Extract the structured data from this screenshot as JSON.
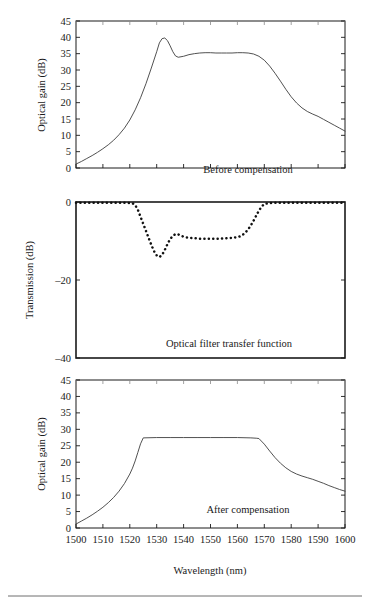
{
  "figure": {
    "shared_xlabel": "Wavelength (nm)",
    "x_ticks": [
      1500,
      1510,
      1520,
      1530,
      1540,
      1550,
      1560,
      1570,
      1580,
      1590,
      1600
    ],
    "xlim": [
      1500,
      1600
    ],
    "line_color": "#3d3d3d",
    "dotted_color": "#111111",
    "axis_color": "#1a1a1a"
  },
  "chart_data": [
    {
      "type": "line",
      "panel": "top",
      "title": "",
      "annotation": "Before compensation",
      "xlabel": "",
      "ylabel": "Optical gain (dB)",
      "xlim": [
        1500,
        1600
      ],
      "ylim": [
        0,
        45
      ],
      "y_ticks": [
        0,
        5,
        10,
        15,
        20,
        25,
        30,
        35,
        40,
        45
      ],
      "x_ticks": [
        1500,
        1510,
        1520,
        1530,
        1540,
        1550,
        1560,
        1570,
        1580,
        1590,
        1600
      ],
      "grid": false,
      "legend": "none",
      "style": "solid",
      "x": [
        1500,
        1502,
        1504,
        1506,
        1508,
        1510,
        1512,
        1514,
        1516,
        1518,
        1520,
        1522,
        1524,
        1526,
        1528,
        1530,
        1531,
        1532,
        1533,
        1534,
        1535,
        1536,
        1537,
        1538,
        1540,
        1542,
        1544,
        1546,
        1548,
        1550,
        1552,
        1554,
        1556,
        1558,
        1560,
        1562,
        1564,
        1566,
        1568,
        1570,
        1572,
        1574,
        1576,
        1578,
        1580,
        1582,
        1584,
        1586,
        1588,
        1590,
        1592,
        1594,
        1596,
        1598,
        1600
      ],
      "y": [
        1.2,
        2.0,
        2.9,
        3.8,
        4.8,
        5.9,
        7.1,
        8.5,
        10.2,
        12.2,
        14.7,
        17.8,
        21.5,
        25.8,
        30.6,
        35.6,
        38.3,
        39.6,
        39.8,
        39.0,
        37.4,
        35.6,
        34.3,
        33.9,
        34.2,
        34.7,
        35.0,
        35.2,
        35.3,
        35.3,
        35.2,
        35.2,
        35.2,
        35.2,
        35.3,
        35.3,
        35.2,
        34.9,
        34.2,
        33.0,
        31.2,
        29.0,
        26.6,
        24.1,
        21.8,
        19.9,
        18.4,
        17.3,
        16.5,
        15.8,
        14.9,
        14.0,
        13.1,
        12.2,
        11.3
      ]
    },
    {
      "type": "line",
      "panel": "middle",
      "title": "",
      "annotation": "Optical filter transfer function",
      "xlabel": "",
      "ylabel": "Transmission (dB)",
      "xlim": [
        1500,
        1600
      ],
      "ylim": [
        -40,
        0
      ],
      "y_ticks": [
        -40,
        -20,
        0
      ],
      "x_ticks": [
        1500,
        1510,
        1520,
        1530,
        1540,
        1550,
        1560,
        1570,
        1580,
        1590,
        1600
      ],
      "grid": false,
      "legend": "none",
      "style": "dotted",
      "x": [
        1500,
        1503,
        1506,
        1509,
        1512,
        1515,
        1518,
        1521,
        1522,
        1523,
        1524,
        1525,
        1526,
        1527,
        1528,
        1529,
        1530,
        1531,
        1532,
        1533,
        1534,
        1535,
        1536,
        1537,
        1538,
        1539,
        1540,
        1542,
        1544,
        1546,
        1548,
        1550,
        1552,
        1554,
        1556,
        1558,
        1560,
        1561,
        1562,
        1563,
        1564,
        1565,
        1566,
        1567,
        1568,
        1569,
        1570,
        1573,
        1576,
        1580,
        1584,
        1588,
        1592,
        1596,
        1600
      ],
      "y": [
        -0.2,
        -0.2,
        -0.2,
        -0.2,
        -0.2,
        -0.2,
        -0.2,
        -0.3,
        -0.8,
        -2.0,
        -3.8,
        -5.6,
        -7.4,
        -9.2,
        -11.0,
        -12.6,
        -13.7,
        -14.1,
        -13.6,
        -12.3,
        -10.8,
        -9.5,
        -8.7,
        -8.2,
        -8.3,
        -8.6,
        -8.9,
        -9.2,
        -9.3,
        -9.4,
        -9.4,
        -9.4,
        -9.4,
        -9.4,
        -9.3,
        -9.2,
        -9.0,
        -8.8,
        -8.4,
        -7.8,
        -7.0,
        -6.0,
        -4.8,
        -3.5,
        -2.2,
        -1.2,
        -0.5,
        -0.2,
        -0.2,
        -0.2,
        -0.2,
        -0.2,
        -0.2,
        -0.2,
        -0.2
      ]
    },
    {
      "type": "line",
      "panel": "bottom",
      "title": "",
      "annotation": "After compensation",
      "xlabel": "Wavelength (nm)",
      "ylabel": "Optical gain (dB)",
      "xlim": [
        1500,
        1600
      ],
      "ylim": [
        0,
        45
      ],
      "y_ticks": [
        0,
        5,
        10,
        15,
        20,
        25,
        30,
        35,
        40,
        45
      ],
      "x_ticks": [
        1500,
        1510,
        1520,
        1530,
        1540,
        1550,
        1560,
        1570,
        1580,
        1590,
        1600
      ],
      "grid": false,
      "legend": "none",
      "style": "solid",
      "x": [
        1500,
        1502,
        1504,
        1506,
        1508,
        1510,
        1512,
        1514,
        1516,
        1518,
        1520,
        1521,
        1522,
        1523,
        1524,
        1525,
        1530,
        1535,
        1540,
        1545,
        1550,
        1555,
        1560,
        1565,
        1567,
        1568,
        1570,
        1572,
        1574,
        1576,
        1578,
        1580,
        1582,
        1584,
        1586,
        1588,
        1590,
        1592,
        1594,
        1596,
        1598,
        1600
      ],
      "y": [
        1.2,
        2.1,
        3.0,
        4.0,
        5.1,
        6.3,
        7.7,
        9.3,
        11.2,
        13.5,
        16.4,
        18.2,
        20.4,
        23.0,
        25.6,
        27.4,
        27.5,
        27.5,
        27.5,
        27.5,
        27.5,
        27.5,
        27.5,
        27.4,
        27.3,
        27.2,
        25.5,
        23.4,
        21.4,
        19.7,
        18.3,
        17.2,
        16.4,
        15.8,
        15.3,
        14.8,
        14.2,
        13.6,
        12.9,
        12.3,
        11.7,
        11.2
      ]
    }
  ]
}
